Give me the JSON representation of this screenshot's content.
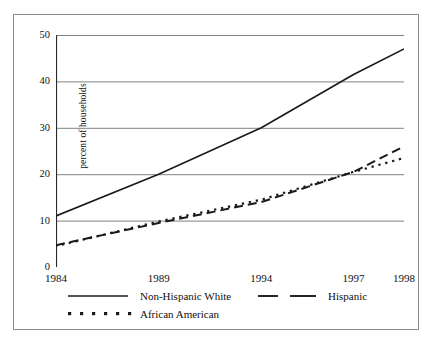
{
  "chart_data": {
    "type": "line",
    "title": "",
    "xlabel": "",
    "ylabel": "percent of households",
    "x_tick_labels": [
      "1984",
      "1989",
      "1994",
      "1997",
      "1998"
    ],
    "x_tick_values": [
      1984,
      1989,
      1994,
      1997,
      1998
    ],
    "y_tick_labels": [
      "0",
      "10",
      "20",
      "30",
      "40",
      "50"
    ],
    "y_tick_values": [
      0,
      10,
      20,
      30,
      40,
      50
    ],
    "ylim": [
      0,
      50
    ],
    "grid": "horizontal",
    "legend_position": "below-axis",
    "x_axis_scale": "categorical-uneven",
    "series": [
      {
        "name": "Non-Hispanic White",
        "style": "solid",
        "color": "#1a1a1a",
        "x": [
          1984,
          1989,
          1994,
          1997,
          1998
        ],
        "values": [
          11.0,
          20.0,
          30.0,
          41.5,
          47.0
        ]
      },
      {
        "name": "Hispanic",
        "style": "dashed",
        "color": "#1a1a1a",
        "x": [
          1984,
          1989,
          1994,
          1997,
          1998
        ],
        "values": [
          4.7,
          9.5,
          14.0,
          20.5,
          26.0
        ]
      },
      {
        "name": "African American",
        "style": "dotted",
        "color": "#1a1a1a",
        "x": [
          1984,
          1989,
          1994,
          1997,
          1998
        ],
        "values": [
          4.5,
          9.8,
          14.5,
          20.5,
          23.5
        ]
      }
    ]
  },
  "legend": {
    "items": [
      {
        "label": "Non-Hispanic White",
        "style": "solid"
      },
      {
        "label": "Hispanic",
        "style": "dashed"
      },
      {
        "label": "African American",
        "style": "dotted"
      }
    ]
  },
  "colors": {
    "line": "#1a1a1a",
    "grid": "#808080",
    "axis": "#2b2b2b",
    "frame": "#8d8d8d",
    "background": "#ffffff"
  }
}
